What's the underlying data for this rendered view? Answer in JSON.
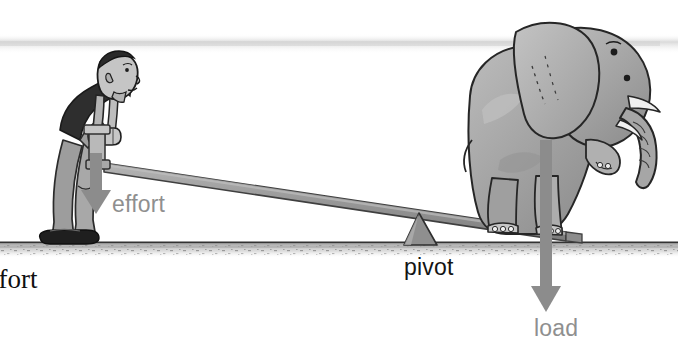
{
  "figure": {
    "type": "mechanics-diagram",
    "width": 678,
    "height": 347,
    "background_color": "#ffffff"
  },
  "labels": {
    "effort": "effort",
    "pivot": "pivot",
    "load": "load",
    "cut_off_caption": "ffort"
  },
  "colors": {
    "arrow_gray": "#8c8c8c",
    "lever_gray": "#9a9a9a",
    "lever_edge": "#4a4a4a",
    "pivot_gray": "#8e8e8e",
    "ground_line": "#3a3a3a",
    "ground_speckle": "#cfcfcf",
    "elephant_body": "#a9a9a9",
    "elephant_outline": "#2b2b2b",
    "man_shirt": "#2e2e2e",
    "man_skin": "#b4b4b4",
    "man_trouser": "#9d9d9d",
    "man_shoe": "#242424",
    "sky_band": "#ededed",
    "label_gray": "#8f8f8f",
    "label_black": "#141414"
  },
  "elements": {
    "sky_band": "faint horizontal gray haze band",
    "ground": "horizontal speckled ground line",
    "lever": "gray plank sloping down left-to-right",
    "pivot_triangle": "gray triangular fulcrum under the lever",
    "effort_arrow": "gray downward arrow at the man's hands",
    "load_arrow": "long gray downward arrow through the elephant",
    "man": "cartoon man bending over pushing down on lever handle",
    "elephant": "cartoon elephant standing on the far end of the lever"
  },
  "icons": {
    "effort_arrow": "arrow-down-icon",
    "load_arrow": "arrow-down-icon",
    "pivot": "triangle-icon"
  }
}
